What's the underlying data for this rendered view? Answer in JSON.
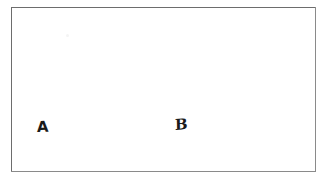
{
  "figure": {
    "background_color": "#ffffff",
    "border_color": "#6d6d6d",
    "ink_color": "#1a1a1a",
    "frame": {
      "name": "empty rectangle outline",
      "x": 11,
      "y": 7,
      "width": 305,
      "height": 165
    },
    "labels": [
      {
        "id": "a",
        "text": "A",
        "x": 37,
        "y": 120,
        "style": "bold hand-lettered"
      },
      {
        "id": "b",
        "text": "B",
        "x": 175,
        "y": 118,
        "style": "light hand-lettered, slanted"
      }
    ],
    "artifacts": [
      {
        "id": "speck",
        "name": "faint scan speck",
        "x": 66,
        "y": 34
      }
    ]
  }
}
